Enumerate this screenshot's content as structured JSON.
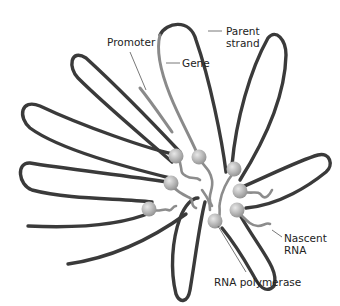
{
  "diagram": {
    "labels": {
      "promoter": "Promoter",
      "gene": "Gene",
      "parent_strand_line1": "Parent",
      "parent_strand_line2": "strand",
      "nascent_rna_line1": "Nascent",
      "nascent_rna_line2": "RNA",
      "rna_polymerase": "RNA polymerase"
    },
    "colors": {
      "strand": "#3a3a3a",
      "gene": "#8a8a8a",
      "polymerase": "#b5b5b5",
      "rna": "#8c8c8c",
      "leader": "#555555"
    },
    "polymerase_count": 8,
    "loop_count": 9
  }
}
